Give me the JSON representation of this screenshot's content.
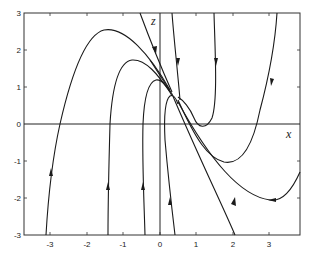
{
  "figure": {
    "type": "phase_portrait",
    "x_axis_label": "x",
    "z_axis_label": "z",
    "xlim": [
      -3.7,
      3.9
    ],
    "ylim": [
      -3,
      3
    ],
    "x_ticks": [
      "-3",
      "-2",
      "-1",
      "0",
      "1",
      "2",
      "3"
    ],
    "y_ticks": [
      "3",
      "2",
      "1",
      "0",
      "-1",
      "-2",
      "-3"
    ],
    "stroke_color": "#1a1a1a",
    "background": "#ffffff"
  }
}
